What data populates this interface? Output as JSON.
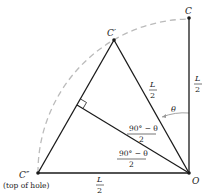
{
  "diagram": {
    "points": {
      "C": {
        "label": "C",
        "x": 189,
        "y": 18
      },
      "C_prime": {
        "label": "C′",
        "x": 114,
        "y": 40
      },
      "C_double_prime": {
        "label": "C″",
        "x": 38,
        "y": 173,
        "note": "(top of hole)"
      },
      "O": {
        "label": "O",
        "x": 189,
        "y": 173
      }
    },
    "labels": {
      "seg_OC_num": "L",
      "seg_OC_den": "2",
      "seg_OCp_num": "L",
      "seg_OCp_den": "2",
      "seg_OCpp_num": "L",
      "seg_OCpp_den": "2",
      "angle_theta": "θ",
      "angle_upper_num": "90° − θ",
      "angle_upper_den": "2",
      "angle_lower_num": "90° − θ",
      "angle_lower_den": "2"
    },
    "colors": {
      "line": "#1a1a1a",
      "dashed_arc": "#bbbbbb",
      "theta_arc": "#999999"
    }
  }
}
